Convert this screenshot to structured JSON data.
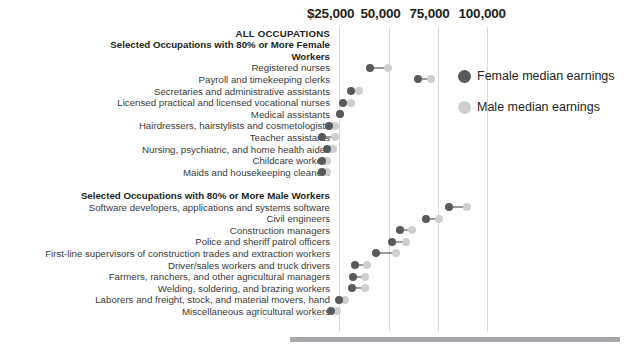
{
  "chart_data": {
    "type": "bar",
    "title": "",
    "subtitle": "",
    "xlabel": "",
    "ylabel": "",
    "axis": {
      "ticks": [
        {
          "label": "$25,000",
          "value": 25000
        },
        {
          "label": "50,000",
          "value": 50000
        },
        {
          "label": "75,000",
          "value": 75000
        },
        {
          "label": "100,000",
          "value": 100000
        }
      ],
      "xlim": [
        8000,
        112000
      ],
      "grid": true
    },
    "legend": {
      "position": "right",
      "entries": [
        {
          "label": "Female median earnings",
          "color": "#58595b",
          "key": "female"
        },
        {
          "label": "Male  median earnings",
          "color": "#cdcecf",
          "key": "male"
        }
      ]
    },
    "series": [
      {
        "name": "Female median earnings",
        "color": "#58595b"
      },
      {
        "name": "Male median earnings",
        "color": "#cdcecf"
      }
    ],
    "rows": [
      {
        "label": "ALL OCCUPATIONS",
        "style": "caps",
        "female": null,
        "male": null
      },
      {
        "label": "Selected Occupations with 80% or More Female",
        "style": "bold",
        "female": null,
        "male": null
      },
      {
        "label": "Workers",
        "style": "bold",
        "female": null,
        "male": null
      },
      {
        "label": "Registered nurses",
        "style": "normal",
        "female": 41000,
        "male": 50000
      },
      {
        "label": "Payroll and timekeeping clerks",
        "style": "normal",
        "female": 65000,
        "male": 72000
      },
      {
        "label": "Secretaries and administrative assistants",
        "style": "normal",
        "female": 31000,
        "male": 35000
      },
      {
        "label": "Licensed practical and licensed vocational nurses",
        "style": "normal",
        "female": 27000,
        "male": 31000
      },
      {
        "label": "Medical assistants",
        "style": "normal",
        "female": 25500,
        "male": 25500
      },
      {
        "label": "Hairdressers, hairstylists and cosmetologists",
        "style": "normal",
        "female": 20000,
        "male": 23000
      },
      {
        "label": "Teacher assistants",
        "style": "normal",
        "female": 16500,
        "male": 23000
      },
      {
        "label": "Nursing, psychiatric, and home health aides",
        "style": "normal",
        "female": 19000,
        "male": 22000
      },
      {
        "label": "Childcare workers",
        "style": "normal",
        "female": 16500,
        "male": 19000
      },
      {
        "label": "Maids and housekeeping cleaners",
        "style": "normal",
        "female": 16500,
        "male": 19000
      },
      {
        "label": "",
        "style": "normal",
        "female": null,
        "male": null
      },
      {
        "label": "Selected Occupations with 80% or More Male Workers",
        "style": "bold",
        "female": null,
        "male": null
      },
      {
        "label": "Software developers, applications and systems software",
        "style": "normal",
        "female": 81000,
        "male": 90000
      },
      {
        "label": "Civil engineers",
        "style": "normal",
        "female": 69000,
        "male": 76000
      },
      {
        "label": "Construction managers",
        "style": "normal",
        "female": 56000,
        "male": 62000
      },
      {
        "label": "Police and sheriff patrol officers",
        "style": "normal",
        "female": 52000,
        "male": 59000
      },
      {
        "label": "First-line supervisors of construction trades and extraction workers",
        "style": "normal",
        "female": 44000,
        "male": 54000
      },
      {
        "label": "Driver/sales workers and truck drivers",
        "style": "normal",
        "female": 33000,
        "male": 39000
      },
      {
        "label": "Farmers, ranchers, and other agricultural managers",
        "style": "normal",
        "female": 32000,
        "male": 38000
      },
      {
        "label": "Welding, soldering, and brazing workers",
        "style": "normal",
        "female": 31500,
        "male": 38000
      },
      {
        "label": "Laborers and freight, stock, and material movers, hand",
        "style": "normal",
        "female": 25000,
        "male": 28000
      },
      {
        "label": "Miscellaneous agricultural workers",
        "style": "normal",
        "female": 21000,
        "male": 24000
      }
    ]
  }
}
